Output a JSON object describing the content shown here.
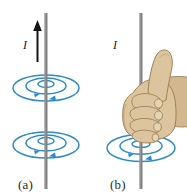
{
  "figure": {
    "background_color": "#ffffff",
    "width": 187,
    "height": 195
  },
  "colors": {
    "field_line": "#2e8bc9",
    "field_line_light": "#5aa8d8",
    "wire": "#808080",
    "wire_dark": "#5e5e5e",
    "current_arrow": "#151515",
    "skin": "#dcc49e",
    "skin_shadow": "#c4a97f",
    "skin_outline": "#9c8257",
    "caption_text": "#2b2b2b"
  },
  "panels": [
    {
      "id": "a",
      "caption": "(a)",
      "current_label": "I",
      "current_direction": "up",
      "wire_orientation": "vertical",
      "has_hand": false,
      "field_ring_groups": [
        {
          "position": "upper",
          "center_y": 88,
          "rings": 3,
          "arrow_direction": "counterclockwise-from-above"
        },
        {
          "position": "lower",
          "center_y": 145,
          "rings": 3,
          "arrow_direction": "counterclockwise-from-above"
        }
      ]
    },
    {
      "id": "b",
      "caption": "(b)",
      "current_label": "I",
      "current_direction": "up",
      "wire_orientation": "vertical",
      "has_hand": true,
      "hand_description": "right hand gripping wire, thumb pointing up along current",
      "field_ring_groups": [
        {
          "position": "lower",
          "center_y": 148,
          "rings": 3,
          "arrow_direction": "counterclockwise-from-above"
        }
      ]
    }
  ]
}
